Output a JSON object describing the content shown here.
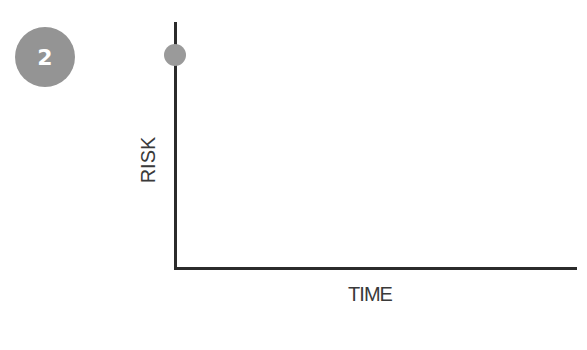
{
  "badge": {
    "number": "2",
    "color": "#949494"
  },
  "chart_data": {
    "type": "scatter",
    "title": "",
    "xlabel": "TIME",
    "ylabel": "RISK",
    "points": [
      {
        "x": 0,
        "y": 0.93
      }
    ],
    "x_ticks": [],
    "y_ticks": [],
    "grid": false,
    "legend": null,
    "point_color": "#9a9a9a",
    "axis_color": "#2b2b2b"
  }
}
